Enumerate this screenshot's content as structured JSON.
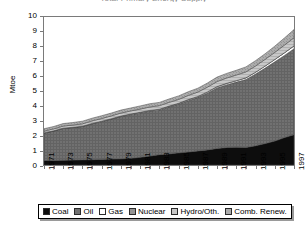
{
  "chart_data": {
    "type": "area",
    "stacked": true,
    "title": "Total Primary Energy Supply",
    "xlabel": "",
    "ylabel": "Mtoe",
    "ylim": [
      0,
      10
    ],
    "yticks": [
      0,
      1,
      2,
      3,
      4,
      5,
      6,
      7,
      8,
      9,
      10
    ],
    "grid": false,
    "legend_position": "bottom",
    "x": [
      1971,
      1972,
      1973,
      1974,
      1975,
      1976,
      1977,
      1978,
      1979,
      1980,
      1981,
      1982,
      1983,
      1984,
      1985,
      1986,
      1987,
      1988,
      1989,
      1990,
      1991,
      1992,
      1993,
      1994,
      1995,
      1996,
      1997
    ],
    "xtick_labels": [
      "1971",
      "1973",
      "1975",
      "1977",
      "1979",
      "1981",
      "1983",
      "1985",
      "1987",
      "1989",
      "1991",
      "1993",
      "1995",
      "1997"
    ],
    "series": [
      {
        "name": "Coal",
        "color": "#0d0d0d",
        "values": [
          0.3,
          0.31,
          0.32,
          0.33,
          0.35,
          0.36,
          0.38,
          0.4,
          0.42,
          0.45,
          0.52,
          0.6,
          0.7,
          0.75,
          0.82,
          0.88,
          0.95,
          1.02,
          1.12,
          1.18,
          1.2,
          1.18,
          1.3,
          1.45,
          1.62,
          1.85,
          2.05
        ]
      },
      {
        "name": "Oil",
        "color": "#6e6e6e",
        "values": [
          1.85,
          1.98,
          2.15,
          2.2,
          2.25,
          2.42,
          2.55,
          2.7,
          2.85,
          2.95,
          3.0,
          3.05,
          3.02,
          3.18,
          3.3,
          3.48,
          3.62,
          3.85,
          4.1,
          4.25,
          4.4,
          4.6,
          4.85,
          5.1,
          5.35,
          5.55,
          5.8
        ]
      },
      {
        "name": "Gas",
        "color": "#ffffff",
        "values": [
          0.02,
          0.02,
          0.02,
          0.02,
          0.02,
          0.03,
          0.03,
          0.03,
          0.04,
          0.04,
          0.04,
          0.04,
          0.05,
          0.05,
          0.05,
          0.06,
          0.06,
          0.07,
          0.08,
          0.09,
          0.1,
          0.11,
          0.12,
          0.14,
          0.16,
          0.18,
          0.2
        ]
      },
      {
        "name": "Nuclear",
        "color": "#8f8f8f",
        "values": [
          0.0,
          0.0,
          0.0,
          0.0,
          0.0,
          0.0,
          0.0,
          0.0,
          0.0,
          0.0,
          0.0,
          0.0,
          0.0,
          0.0,
          0.0,
          0.0,
          0.0,
          0.0,
          0.0,
          0.0,
          0.0,
          0.0,
          0.0,
          0.0,
          0.0,
          0.0,
          0.0
        ]
      },
      {
        "name": "Hydro/Oth.",
        "color": "#c2c2c2",
        "values": [
          0.12,
          0.13,
          0.14,
          0.15,
          0.16,
          0.17,
          0.18,
          0.19,
          0.2,
          0.21,
          0.22,
          0.23,
          0.24,
          0.25,
          0.26,
          0.28,
          0.3,
          0.32,
          0.34,
          0.36,
          0.38,
          0.4,
          0.42,
          0.45,
          0.48,
          0.52,
          0.55
        ]
      },
      {
        "name": "Comb. Renew.",
        "color": "#a8a8a8",
        "values": [
          0.16,
          0.16,
          0.17,
          0.17,
          0.18,
          0.18,
          0.19,
          0.19,
          0.2,
          0.2,
          0.21,
          0.22,
          0.22,
          0.23,
          0.24,
          0.25,
          0.26,
          0.28,
          0.3,
          0.31,
          0.32,
          0.34,
          0.36,
          0.38,
          0.42,
          0.48,
          0.55
        ]
      }
    ],
    "totals": [
      2.45,
      2.6,
      2.8,
      2.87,
      2.96,
      3.16,
      3.33,
      3.51,
      3.71,
      3.85,
      3.99,
      4.14,
      4.23,
      4.46,
      4.67,
      4.95,
      5.19,
      5.54,
      5.94,
      6.19,
      6.4,
      6.63,
      7.05,
      7.52,
      8.03,
      8.58,
      9.15
    ]
  },
  "legend": {
    "items": [
      {
        "label": "Coal",
        "swatch": "coal-swatch"
      },
      {
        "label": "Oil",
        "swatch": "oil-swatch"
      },
      {
        "label": "Gas",
        "swatch": "gas-swatch"
      },
      {
        "label": "Nuclear",
        "swatch": "nuclear-swatch"
      },
      {
        "label": "Hydro/Oth.",
        "swatch": "hydro-swatch"
      },
      {
        "label": "Comb. Renew.",
        "swatch": "comb-renew-swatch"
      }
    ]
  }
}
